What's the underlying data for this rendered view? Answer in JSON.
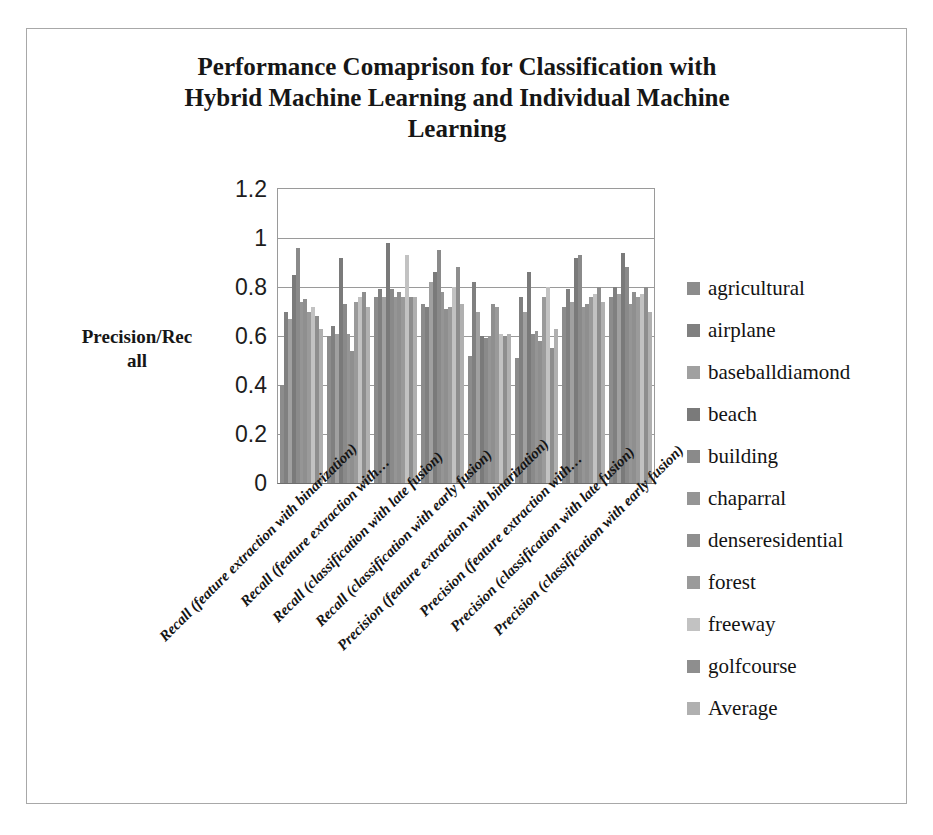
{
  "chart_data": {
    "type": "bar",
    "title": "Performance Comaprison for Classification with Hybrid Machine Learning and Individual Machine Learning",
    "title_lines": [
      "Performance Comaprison for Classification with",
      "Hybrid Machine Learning and Individual Machine",
      "Learning"
    ],
    "xlabel": "",
    "ylabel": "Precision/Recall",
    "ylabel_lines": [
      "Precision/Rec",
      "all"
    ],
    "ylim": [
      0,
      1.2
    ],
    "ytick_values": [
      0,
      0.2,
      0.4,
      0.6,
      0.8,
      1,
      1.2
    ],
    "ytick_labels": [
      "0",
      "0.2",
      "0.4",
      "0.6",
      "0.8",
      "1",
      "1.2"
    ],
    "grid": true,
    "legend_position": "right",
    "categories": [
      "Recall (feature extraction with binarization)",
      "Recall (feature extraction with…",
      "Recall (classification with late fusion)",
      "Recall (classification with early fusion)",
      "Precision (feature extraction with binarization)",
      "Precision (feature extraction with…",
      "Precision (classification with late fusion)",
      "Precision (classification with early fusion)"
    ],
    "series": [
      {
        "name": "agricultural",
        "color": "#8c8c8c",
        "values": [
          0.4,
          0.6,
          0.76,
          0.73,
          0.52,
          0.51,
          0.72,
          0.76
        ]
      },
      {
        "name": "airplane",
        "color": "#808080",
        "values": [
          0.7,
          0.64,
          0.79,
          0.72,
          0.82,
          0.76,
          0.79,
          0.8
        ]
      },
      {
        "name": "baseballdiamond",
        "color": "#a0a0a0",
        "values": [
          0.67,
          0.61,
          0.76,
          0.82,
          0.7,
          0.7,
          0.74,
          0.77
        ]
      },
      {
        "name": "beach",
        "color": "#7a7a7a",
        "values": [
          0.85,
          0.92,
          0.98,
          0.86,
          0.6,
          0.86,
          0.92,
          0.94
        ]
      },
      {
        "name": "building",
        "color": "#8a8a8a",
        "values": [
          0.96,
          0.73,
          0.79,
          0.95,
          0.59,
          0.61,
          0.93,
          0.88
        ]
      },
      {
        "name": "chaparral",
        "color": "#959595",
        "values": [
          0.74,
          0.61,
          0.76,
          0.78,
          0.6,
          0.62,
          0.72,
          0.73
        ]
      },
      {
        "name": "denseresidential",
        "color": "#8f8f8f",
        "values": [
          0.75,
          0.54,
          0.78,
          0.71,
          0.73,
          0.58,
          0.73,
          0.78
        ]
      },
      {
        "name": "forest",
        "color": "#9a9a9a",
        "values": [
          0.7,
          0.74,
          0.76,
          0.72,
          0.72,
          0.76,
          0.76,
          0.76
        ]
      },
      {
        "name": "freeway",
        "color": "#c2c2c2",
        "values": [
          0.72,
          0.76,
          0.93,
          0.8,
          0.61,
          0.8,
          0.77,
          0.77
        ]
      },
      {
        "name": "golfcourse",
        "color": "#8e8e8e",
        "values": [
          0.68,
          0.78,
          0.76,
          0.88,
          0.6,
          0.55,
          0.8,
          0.8
        ]
      },
      {
        "name": "Average",
        "color": "#b0b0b0",
        "values": [
          0.63,
          0.72,
          0.76,
          0.73,
          0.61,
          0.63,
          0.74,
          0.7
        ]
      }
    ]
  },
  "legend": {
    "items": [
      {
        "label": "agricultural"
      },
      {
        "label": "airplane"
      },
      {
        "label": "baseballdiamond"
      },
      {
        "label": "beach"
      },
      {
        "label": "building"
      },
      {
        "label": "chaparral"
      },
      {
        "label": "denseresidential"
      },
      {
        "label": "forest"
      },
      {
        "label": "freeway"
      },
      {
        "label": "golfcourse"
      },
      {
        "label": "Average"
      }
    ]
  },
  "colors": {
    "frame_border": "#a8a8a8",
    "plot_border": "#9a9a9a",
    "gridline": "#9a9a9a",
    "text": "#161616",
    "background": "#ffffff"
  }
}
